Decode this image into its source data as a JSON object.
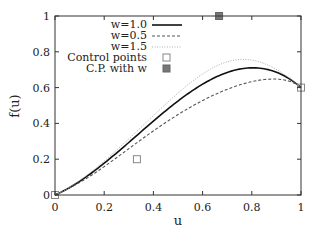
{
  "chart_data": {
    "type": "line",
    "title": "",
    "xlabel": "u",
    "ylabel": "f(u)",
    "xlim": [
      0,
      1
    ],
    "ylim": [
      0,
      1
    ],
    "grid": false,
    "legend_position": "top-left-inside",
    "xticks": [
      "0",
      "0.2",
      "0.4",
      "0.6",
      "0.8",
      "1"
    ],
    "yticks": [
      "0",
      "0.2",
      "0.4",
      "0.6",
      "0.8",
      "1"
    ],
    "control_points": [
      {
        "x": 0,
        "y": 0
      },
      {
        "x": 0.333,
        "y": 0.2
      },
      {
        "x": 0.667,
        "y": 1.0
      },
      {
        "x": 1.0,
        "y": 0.6
      }
    ],
    "weighted_control_point_index": 2,
    "series": [
      {
        "name": "w=1.0",
        "weight": 1.0,
        "style": "solid",
        "color": "#111111",
        "peak": {
          "x": 0.8,
          "y": 0.71
        },
        "end": {
          "x": 1.0,
          "y": 0.6
        }
      },
      {
        "name": "w=0.5",
        "weight": 0.5,
        "style": "dashed",
        "color": "#555555",
        "peak": {
          "x": 0.87,
          "y": 0.64
        },
        "end": {
          "x": 1.0,
          "y": 0.6
        }
      },
      {
        "name": "w=1.5",
        "weight": 1.5,
        "style": "dotted",
        "color": "#aaaaaa",
        "peak": {
          "x": 0.77,
          "y": 0.75
        },
        "end": {
          "x": 1.0,
          "y": 0.6
        }
      },
      {
        "name": "Control points",
        "style": "open-square-marker",
        "color": "#888888",
        "points": [
          {
            "x": 0,
            "y": 0
          },
          {
            "x": 0.333,
            "y": 0.2
          },
          {
            "x": 1.0,
            "y": 0.6
          }
        ]
      },
      {
        "name": "C.P. with w",
        "style": "filled-square-marker",
        "color": "#777777",
        "points": [
          {
            "x": 0.667,
            "y": 1.0
          }
        ]
      }
    ]
  },
  "legend": {
    "items": [
      {
        "label": "w=1.0"
      },
      {
        "label": "w=0.5"
      },
      {
        "label": "w=1.5"
      },
      {
        "label": "Control points"
      },
      {
        "label": "C.P. with w"
      }
    ]
  },
  "axes": {
    "x_label": "u",
    "y_label": "f(u)"
  }
}
